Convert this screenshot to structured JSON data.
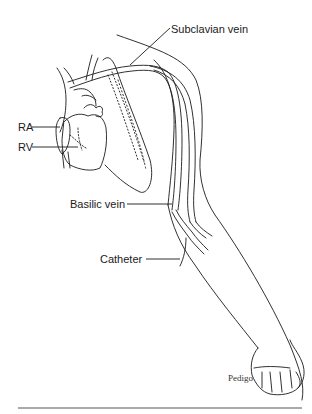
{
  "figure": {
    "labels": {
      "subclavian_vein": "Subclavian vein",
      "ra": "RA",
      "rv": "RV",
      "basilic_vein": "Basilic vein",
      "catheter": "Catheter"
    },
    "credit": "Pedigo",
    "colors": {
      "ink": "#1a1a1a",
      "background": "#ffffff"
    }
  }
}
